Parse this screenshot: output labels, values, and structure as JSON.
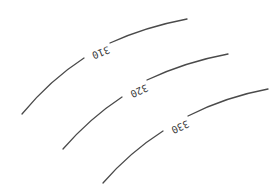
{
  "map": {
    "type": "contour-lines",
    "colors": {
      "line": "#4a4a4a",
      "label": "#3a3a3a",
      "background": "#ffffff"
    },
    "contours": [
      {
        "label": "310"
      },
      {
        "label": "320"
      },
      {
        "label": "330"
      }
    ]
  }
}
